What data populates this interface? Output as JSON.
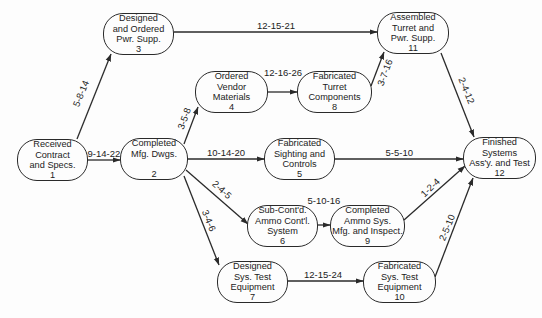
{
  "diagram": {
    "type": "PERT network",
    "nodes": [
      {
        "id": 1,
        "lines": [
          "Received",
          "Contract",
          "and Specs.",
          "1"
        ],
        "x": 17,
        "y": 139,
        "w": 71,
        "h": 42
      },
      {
        "id": 2,
        "lines": [
          "Completed",
          "Mfg. Dwgs.",
          "",
          "2"
        ],
        "x": 120,
        "y": 138,
        "w": 68,
        "h": 42
      },
      {
        "id": 3,
        "lines": [
          "Designed",
          "and Ordered",
          "Pwr. Supp.",
          "3"
        ],
        "x": 103,
        "y": 13,
        "w": 71,
        "h": 42
      },
      {
        "id": 4,
        "lines": [
          "Ordered",
          "Vendor",
          "Materials",
          "4"
        ],
        "x": 195,
        "y": 71,
        "w": 73,
        "h": 42
      },
      {
        "id": 5,
        "lines": [
          "Fabricated",
          "Sighting and",
          "Controls",
          "5"
        ],
        "x": 264,
        "y": 138,
        "w": 71,
        "h": 42
      },
      {
        "id": 6,
        "lines": [
          "Sub-Cont'd.",
          "Ammo Cont'l.",
          "System",
          "6"
        ],
        "x": 247,
        "y": 205,
        "w": 71,
        "h": 42
      },
      {
        "id": 7,
        "lines": [
          "Designed",
          "Sys. Test",
          "Equipment",
          "7"
        ],
        "x": 217,
        "y": 261,
        "w": 71,
        "h": 42
      },
      {
        "id": 8,
        "lines": [
          "Fabricated",
          "Turret",
          "Components",
          "8"
        ],
        "x": 297,
        "y": 71,
        "w": 75,
        "h": 42
      },
      {
        "id": 9,
        "lines": [
          "Completed",
          "Ammo Sys.",
          "Mfg. and Inspect.",
          "9"
        ],
        "x": 330,
        "y": 205,
        "w": 75,
        "h": 42
      },
      {
        "id": 10,
        "lines": [
          "Fabricated",
          "Sys. Test",
          "Equipment",
          "10"
        ],
        "x": 363,
        "y": 261,
        "w": 73,
        "h": 42
      },
      {
        "id": 11,
        "lines": [
          "Assembled",
          "Turret and",
          "Pwr. Supp.",
          "11"
        ],
        "x": 377,
        "y": 12,
        "w": 72,
        "h": 42
      },
      {
        "id": 12,
        "lines": [
          "Finished",
          "Systems",
          "Ass'y. and Test",
          "12"
        ],
        "x": 463,
        "y": 137,
        "w": 73,
        "h": 42
      }
    ],
    "edges": [
      {
        "from": 1,
        "to": 3,
        "label": "5-8-14",
        "x1": 77,
        "y1": 139,
        "x2": 111,
        "y2": 54,
        "lx": 80,
        "ly": 93,
        "rot": -68
      },
      {
        "from": 1,
        "to": 2,
        "label": "9-14-22",
        "x1": 88,
        "y1": 160,
        "x2": 120,
        "y2": 160,
        "lx": 104,
        "ly": 153,
        "rot": 0
      },
      {
        "from": 2,
        "to": 4,
        "label": "3-5-8",
        "x1": 184,
        "y1": 144,
        "x2": 198,
        "y2": 107,
        "lx": 184,
        "ly": 118,
        "rot": -70
      },
      {
        "from": 2,
        "to": 5,
        "label": "10-14-20",
        "x1": 188,
        "y1": 159,
        "x2": 264,
        "y2": 159,
        "lx": 226,
        "ly": 152,
        "rot": 0
      },
      {
        "from": 2,
        "to": 6,
        "label": "2-4-5",
        "x1": 186,
        "y1": 170,
        "x2": 248,
        "y2": 224,
        "lx": 222,
        "ly": 189,
        "rot": 42
      },
      {
        "from": 2,
        "to": 7,
        "label": "3-4-6",
        "x1": 184,
        "y1": 176,
        "x2": 219,
        "y2": 265,
        "lx": 209,
        "ly": 220,
        "rot": 68
      },
      {
        "from": 3,
        "to": 11,
        "label": "12-15-21",
        "x1": 174,
        "y1": 32,
        "x2": 377,
        "y2": 32,
        "lx": 276,
        "ly": 25,
        "rot": 0
      },
      {
        "from": 4,
        "to": 8,
        "label": "12-16-26",
        "x1": 268,
        "y1": 92,
        "x2": 297,
        "y2": 92,
        "lx": 283,
        "ly": 72,
        "rot": 0
      },
      {
        "from": 8,
        "to": 11,
        "label": "3-7-16",
        "x1": 371,
        "y1": 86,
        "x2": 384,
        "y2": 52,
        "lx": 384,
        "ly": 72,
        "rot": -70
      },
      {
        "from": 11,
        "to": 12,
        "label": "2-4-12",
        "x1": 441,
        "y1": 53,
        "x2": 474,
        "y2": 137,
        "lx": 466,
        "ly": 90,
        "rot": 68
      },
      {
        "from": 5,
        "to": 12,
        "label": "5-5-10",
        "x1": 335,
        "y1": 159,
        "x2": 463,
        "y2": 159,
        "lx": 399,
        "ly": 152,
        "rot": 0
      },
      {
        "from": 6,
        "to": 9,
        "label": "5-10-16",
        "x1": 318,
        "y1": 225,
        "x2": 330,
        "y2": 225,
        "lx": 324,
        "ly": 200,
        "rot": 0
      },
      {
        "from": 9,
        "to": 12,
        "label": "1-2-4",
        "x1": 404,
        "y1": 220,
        "x2": 465,
        "y2": 166,
        "lx": 430,
        "ly": 187,
        "rot": -44
      },
      {
        "from": 7,
        "to": 10,
        "label": "12-15-24",
        "x1": 288,
        "y1": 281,
        "x2": 363,
        "y2": 281,
        "lx": 323,
        "ly": 274,
        "rot": 0
      },
      {
        "from": 10,
        "to": 12,
        "label": "2-5-10",
        "x1": 435,
        "y1": 277,
        "x2": 473,
        "y2": 178,
        "lx": 446,
        "ly": 227,
        "rot": -68
      }
    ],
    "colors": {
      "line": "#2a2a2a",
      "background": "#fdfdfd",
      "text": "#222222"
    }
  }
}
